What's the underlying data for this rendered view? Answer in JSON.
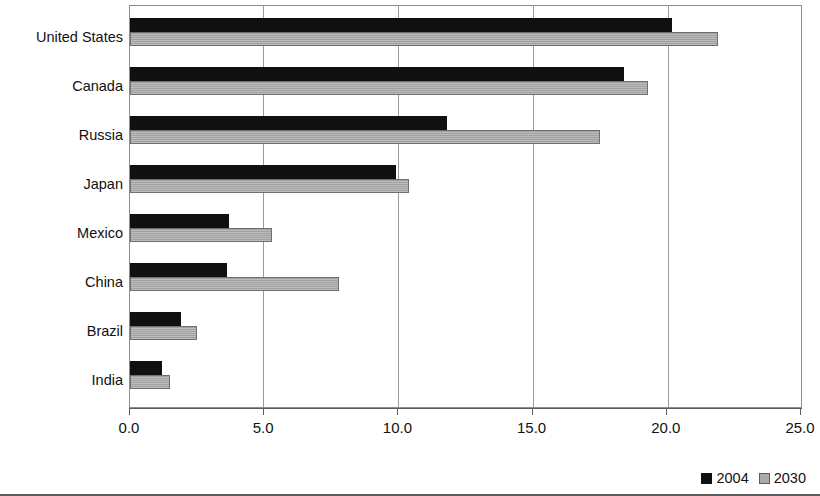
{
  "chart_data": {
    "type": "bar",
    "orientation": "horizontal",
    "title": "",
    "subtitle": "",
    "xlabel": "",
    "ylabel": "",
    "categories": [
      "United States",
      "Canada",
      "Russia",
      "Japan",
      "Mexico",
      "China",
      "Brazil",
      "India"
    ],
    "series": [
      {
        "name": "2004",
        "color": "#101010",
        "values": [
          20.2,
          18.4,
          11.8,
          9.9,
          3.7,
          3.6,
          1.9,
          1.2
        ]
      },
      {
        "name": "2030",
        "color": "#a9a9a9",
        "values": [
          21.9,
          19.3,
          17.5,
          10.4,
          5.3,
          7.8,
          2.5,
          1.5
        ]
      }
    ],
    "xlim": [
      0.0,
      25.0
    ],
    "xticks": [
      0.0,
      5.0,
      10.0,
      15.0,
      20.0,
      25.0
    ],
    "xtick_labels": [
      "0.0",
      "5.0",
      "10.0",
      "15.0",
      "20.0",
      "25.0"
    ],
    "grid": "vertical",
    "legend_position": "bottom-right",
    "legend": [
      "2004",
      "2030"
    ]
  }
}
